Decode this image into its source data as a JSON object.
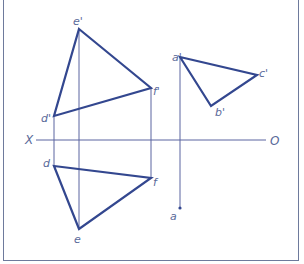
{
  "diagram": {
    "type": "orthographic-projection",
    "colors": {
      "object_lines": "#33478f",
      "projection_lines": "#5a65a0",
      "labels": "#5a6a9a",
      "frame": "#6e7a9c"
    },
    "axis": {
      "left_label": "X",
      "right_label": "O"
    },
    "points": {
      "e_prime": "e'",
      "f_prime": "f'",
      "d_prime": "d'",
      "a_prime": "a'",
      "b_prime": "b'",
      "c_prime": "c'",
      "d": "d",
      "e": "e",
      "f": "f",
      "a": "a"
    }
  }
}
